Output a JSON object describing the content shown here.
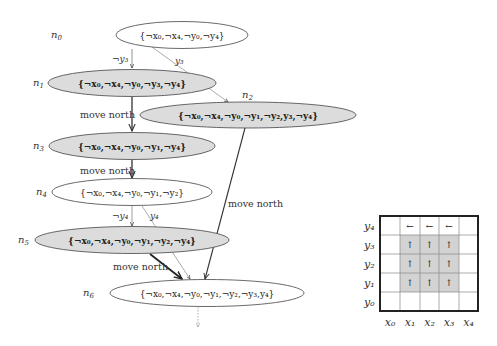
{
  "graph": {
    "nodes": [
      {
        "id": "n0",
        "label": "n",
        "sub": "0",
        "formula": "{¬x₀,¬x₄,¬y₀,¬y₄}",
        "fill": "#ffffff",
        "bold": false
      },
      {
        "id": "n1",
        "label": "n",
        "sub": "1",
        "formula": "{¬x₀,¬x₄,¬y₀,¬y₃,¬y₄}",
        "fill": "#dcdcdc",
        "bold": true
      },
      {
        "id": "n2",
        "label": "n",
        "sub": "2",
        "formula": "{¬x₀,¬x₄,¬y₀,¬y₁,¬y₂,y₃,¬y₄}",
        "fill": "#dcdcdc",
        "bold": true
      },
      {
        "id": "n3",
        "label": "n",
        "sub": "3",
        "formula": "{¬x₀,¬x₄,¬y₀,¬y₁,¬y₄}",
        "fill": "#dcdcdc",
        "bold": true
      },
      {
        "id": "n4",
        "label": "n",
        "sub": "4",
        "formula": "{¬x₀,¬x₄,¬y₀,¬y₁,¬y₂}",
        "fill": "#ffffff",
        "bold": false
      },
      {
        "id": "n5",
        "label": "n",
        "sub": "5",
        "formula": "{¬x₀,¬x₄,¬y₀,¬y₁,¬y₂,¬y₄}",
        "fill": "#dcdcdc",
        "bold": true
      },
      {
        "id": "n6",
        "label": "n",
        "sub": "6",
        "formula": "{¬x₀,¬x₄,¬y₀,¬y₁,¬y₂,¬y₃,y₄}",
        "fill": "#ffffff",
        "bold": false
      }
    ],
    "edges": [
      {
        "from": "n0",
        "to": "n1",
        "label": "¬y₃"
      },
      {
        "from": "n0",
        "to": "n2",
        "label": "y₃"
      },
      {
        "from": "n1",
        "to": "n3",
        "label": "move north"
      },
      {
        "from": "n3",
        "to": "n4",
        "label": "move north"
      },
      {
        "from": "n2",
        "to": "n6",
        "label": "move north"
      },
      {
        "from": "n4",
        "to": "n5",
        "label": "¬y₄"
      },
      {
        "from": "n4",
        "to": "n6",
        "label": "y₄"
      },
      {
        "from": "n5",
        "to": "n6",
        "label": "move north"
      },
      {
        "from": "n6",
        "to": "continuation",
        "label": ""
      }
    ]
  },
  "grid": {
    "row_labels": [
      "y₄",
      "y₃",
      "y₂",
      "y₁",
      "y₀"
    ],
    "col_labels": [
      "x₀",
      "x₁",
      "x₂",
      "x₃",
      "x₄"
    ],
    "shaded_color": "#d3d3d3",
    "cells": [
      [
        "",
        "←",
        "←",
        "←",
        ""
      ],
      [
        "",
        "↑",
        "↑",
        "↑",
        ""
      ],
      [
        "",
        "↑",
        "↑",
        "↑",
        ""
      ],
      [
        "",
        "↑",
        "↑",
        "↑",
        ""
      ],
      [
        "",
        "",
        "",
        "",
        ""
      ]
    ],
    "shaded": [
      [
        false,
        false,
        false,
        false,
        false
      ],
      [
        false,
        true,
        true,
        true,
        false
      ],
      [
        false,
        true,
        true,
        true,
        false
      ],
      [
        false,
        true,
        true,
        true,
        false
      ],
      [
        false,
        false,
        false,
        false,
        false
      ]
    ]
  }
}
